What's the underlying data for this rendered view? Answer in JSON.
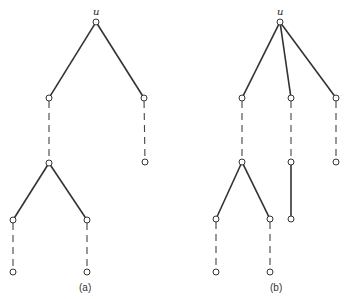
{
  "figure": {
    "panel_a": {
      "caption": "(a)",
      "root_label": "u",
      "nodes": [
        {
          "id": "u",
          "x": 96,
          "y": 22
        },
        {
          "id": "a1",
          "x": 49,
          "y": 98
        },
        {
          "id": "a2",
          "x": 144,
          "y": 98
        },
        {
          "id": "a3",
          "x": 49,
          "y": 163
        },
        {
          "id": "a4",
          "x": 145,
          "y": 162
        },
        {
          "id": "a5",
          "x": 13,
          "y": 220
        },
        {
          "id": "a6",
          "x": 87,
          "y": 220
        },
        {
          "id": "a7",
          "x": 13,
          "y": 272
        },
        {
          "id": "a8",
          "x": 87,
          "y": 272
        }
      ],
      "solid_edges": [
        [
          "u",
          "a1"
        ],
        [
          "u",
          "a2"
        ],
        [
          "a3",
          "a5"
        ],
        [
          "a3",
          "a6"
        ]
      ],
      "dashed_edges": [
        [
          "a1",
          "a3"
        ],
        [
          "a2",
          "a4"
        ],
        [
          "a5",
          "a7"
        ],
        [
          "a6",
          "a8"
        ]
      ]
    },
    "panel_b": {
      "caption": "(b)",
      "root_label": "u",
      "nodes": [
        {
          "id": "u",
          "x": 280,
          "y": 22
        },
        {
          "id": "b1",
          "x": 242,
          "y": 98
        },
        {
          "id": "b2",
          "x": 291,
          "y": 98
        },
        {
          "id": "b3",
          "x": 336,
          "y": 98
        },
        {
          "id": "b4",
          "x": 242,
          "y": 162
        },
        {
          "id": "b5",
          "x": 291,
          "y": 162
        },
        {
          "id": "b6",
          "x": 336,
          "y": 162
        },
        {
          "id": "b7",
          "x": 216,
          "y": 219
        },
        {
          "id": "b8",
          "x": 270,
          "y": 219
        },
        {
          "id": "b9",
          "x": 291,
          "y": 219
        },
        {
          "id": "b10",
          "x": 216,
          "y": 272
        },
        {
          "id": "b11",
          "x": 270,
          "y": 272
        }
      ],
      "solid_edges": [
        [
          "u",
          "b1"
        ],
        [
          "u",
          "b2"
        ],
        [
          "u",
          "b3"
        ],
        [
          "b4",
          "b7"
        ],
        [
          "b4",
          "b8"
        ],
        [
          "b5",
          "b9"
        ]
      ],
      "dashed_edges": [
        [
          "b1",
          "b4"
        ],
        [
          "b2",
          "b5"
        ],
        [
          "b3",
          "b6"
        ],
        [
          "b7",
          "b10"
        ],
        [
          "b8",
          "b11"
        ]
      ]
    }
  }
}
